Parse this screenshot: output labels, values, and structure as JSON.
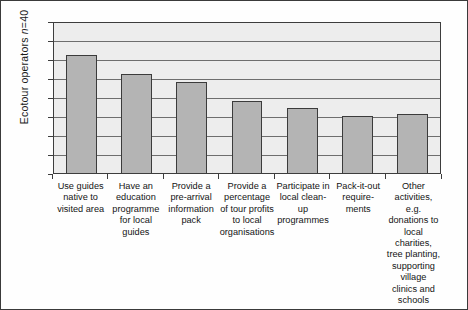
{
  "chart_data": {
    "type": "bar",
    "title": "",
    "xlabel": "",
    "ylabel": "Ecotour operators n=40",
    "ylim": [
      0,
      40
    ],
    "ytick_step": 5,
    "yticks": [
      40,
      35,
      30,
      25,
      20,
      15,
      10,
      5,
      0
    ],
    "grid": true,
    "legend": null,
    "categories": [
      "Use guides native to visited area",
      "Have an education programme for local guides",
      "Provide a pre-arrival information pack",
      "Provide a percentage of tour profits to local organisations",
      "Participate in local clean-up programmes",
      "Pack-it-out require-ments",
      "Other activities, e.g. donations to local charities, tree planting, supporting village clinics and schools"
    ],
    "values": [
      31,
      26,
      24,
      19,
      17,
      15,
      15.5
    ],
    "colors": {
      "bar_fill": "#b4b4b4",
      "bar_edge": "#3b3b3b",
      "plot_background": "#ededed",
      "gridline": "#6e6e6e",
      "text": "#141414"
    }
  },
  "axis": {
    "y_title_main": "Ecotour operators ",
    "y_title_italic": "n",
    "y_title_tail": "=40"
  }
}
